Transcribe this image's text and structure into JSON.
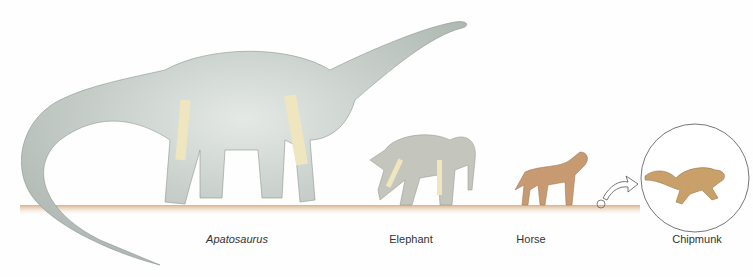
{
  "illustration": {
    "subject": "Size comparison of animals with limb skeletons",
    "colors": {
      "background": "#fefefe",
      "ground": "#e8c9a8",
      "dinosaur": "#bfc6c2",
      "elephant": "#c4c6bd",
      "horse": "#c79a72",
      "chipmunk": "#c9a06a",
      "bone": "#efe6c0"
    },
    "labels": [
      {
        "text": "Apatosaurus",
        "italic": true,
        "x": 237
      },
      {
        "text": "Elephant",
        "italic": false,
        "x": 411
      },
      {
        "text": "Horse",
        "italic": false,
        "x": 531
      },
      {
        "text": "Chipmunk",
        "italic": false,
        "x": 697
      }
    ],
    "inset": {
      "description": "magnified chipmunk in circle with arrow from ground marker"
    }
  }
}
